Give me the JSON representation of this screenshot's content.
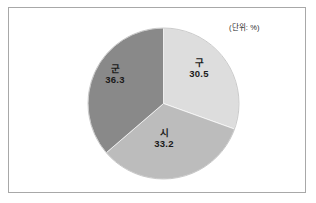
{
  "figure": {
    "unit_note": "(단위: %)",
    "background_color": "#ffffff",
    "frame_color": "#a8a8a8"
  },
  "chart_data": {
    "type": "pie",
    "title": "",
    "subtitle": "",
    "xlabel": "",
    "ylabel": "",
    "unit": "%",
    "unit_note": "(단위: %)",
    "legend_position": "none",
    "labels_inside_slices": true,
    "start_angle_deg": 0,
    "direction": "clockwise",
    "categories": [
      "구",
      "시",
      "군"
    ],
    "values": [
      30.5,
      33.2,
      36.3
    ],
    "colors": [
      "#dddddd",
      "#bcbcbc",
      "#898989"
    ],
    "slices": [
      {
        "label": "구",
        "value": 30.5,
        "value_text": "30.5",
        "color": "#dddddd",
        "start_deg": 0,
        "end_deg": 109.8
      },
      {
        "label": "시",
        "value": 33.2,
        "value_text": "33.2",
        "color": "#bcbcbc",
        "start_deg": 109.8,
        "end_deg": 229.32
      },
      {
        "label": "군",
        "value": 36.3,
        "value_text": "36.3",
        "color": "#898989",
        "start_deg": 229.32,
        "end_deg": 360
      }
    ]
  }
}
